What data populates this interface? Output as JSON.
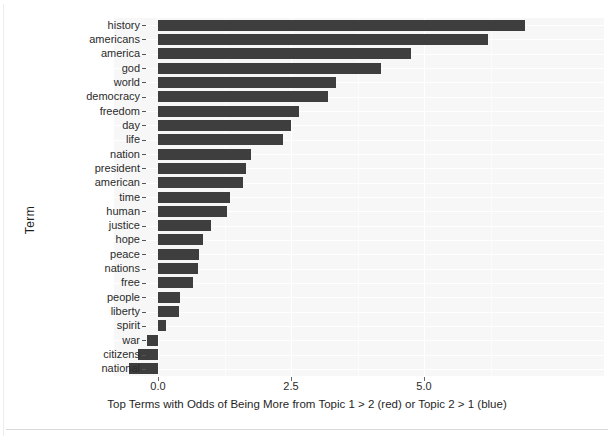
{
  "chart_data": {
    "type": "bar",
    "orientation": "horizontal",
    "title": "",
    "xlabel": "Top Terms with Odds of Being More from Topic 1 > 2 (red) or Topic 2 > 1 (blue)",
    "ylabel": "Term",
    "categories": [
      "history",
      "americans",
      "america",
      "god",
      "world",
      "democracy",
      "freedom",
      "day",
      "life",
      "nation",
      "president",
      "american",
      "time",
      "human",
      "justice",
      "hope",
      "peace",
      "nations",
      "free",
      "people",
      "liberty",
      "spirit",
      "war",
      "citizens",
      "national"
    ],
    "values": [
      6.9,
      6.2,
      4.75,
      4.2,
      3.35,
      3.2,
      2.65,
      2.5,
      2.35,
      1.75,
      1.65,
      1.6,
      1.35,
      1.3,
      1.0,
      0.85,
      0.78,
      0.75,
      0.65,
      0.42,
      0.4,
      0.15,
      -0.2,
      -0.38,
      -0.55
    ],
    "xticks": [
      0.0,
      2.5,
      5.0
    ],
    "xtick_labels": [
      "0.0",
      "2.5",
      "5.0"
    ],
    "xlim": [
      -0.82,
      7.3
    ],
    "grid": true,
    "legend": "none",
    "bar_color": "#3e3e3e",
    "panel_background": "#f7f7f7"
  },
  "axes": {
    "y_axis_title": "Term",
    "x_axis_title": "Top Terms with Odds of Being More from Topic 1 > 2 (red) or Topic 2 > 1 (blue)"
  }
}
